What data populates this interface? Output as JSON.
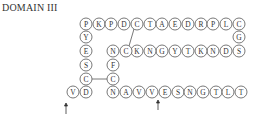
{
  "title": "DOMAIN III",
  "chart_data": {
    "type": "diagram",
    "residue_radius": 6,
    "residues": [
      {
        "id": "top-0",
        "letter": "P",
        "x": 86,
        "y": 24
      },
      {
        "id": "top-1",
        "letter": "K",
        "x": 99,
        "y": 24
      },
      {
        "id": "top-2",
        "letter": "P",
        "x": 111,
        "y": 24
      },
      {
        "id": "top-3",
        "letter": "D",
        "x": 124,
        "y": 24
      },
      {
        "id": "top-4",
        "letter": "C",
        "x": 137,
        "y": 24
      },
      {
        "id": "top-5",
        "letter": "T",
        "x": 150,
        "y": 24
      },
      {
        "id": "top-6",
        "letter": "A",
        "x": 162,
        "y": 24
      },
      {
        "id": "top-7",
        "letter": "E",
        "x": 175,
        "y": 24
      },
      {
        "id": "top-8",
        "letter": "D",
        "x": 188,
        "y": 24
      },
      {
        "id": "top-9",
        "letter": "R",
        "x": 201,
        "y": 24
      },
      {
        "id": "top-10",
        "letter": "P",
        "x": 213,
        "y": 24
      },
      {
        "id": "top-11",
        "letter": "L",
        "x": 226,
        "y": 24
      },
      {
        "id": "top-12",
        "letter": "C",
        "x": 239,
        "y": 24
      },
      {
        "id": "right-0",
        "letter": "G",
        "x": 239,
        "y": 37
      },
      {
        "id": "mid-10",
        "letter": "S",
        "x": 239,
        "y": 51
      },
      {
        "id": "mid-9",
        "letter": "D",
        "x": 226,
        "y": 51
      },
      {
        "id": "mid-8",
        "letter": "N",
        "x": 213,
        "y": 51
      },
      {
        "id": "mid-7",
        "letter": "K",
        "x": 201,
        "y": 51
      },
      {
        "id": "mid-6",
        "letter": "T",
        "x": 188,
        "y": 51
      },
      {
        "id": "mid-5",
        "letter": "Y",
        "x": 175,
        "y": 51
      },
      {
        "id": "mid-4",
        "letter": "G",
        "x": 162,
        "y": 51
      },
      {
        "id": "mid-3",
        "letter": "N",
        "x": 150,
        "y": 51
      },
      {
        "id": "mid-2",
        "letter": "K",
        "x": 137,
        "y": 51
      },
      {
        "id": "mid-1",
        "letter": "C",
        "x": 126,
        "y": 51
      },
      {
        "id": "mid-0",
        "letter": "N",
        "x": 113,
        "y": 51
      },
      {
        "id": "inner-0",
        "letter": "F",
        "x": 113,
        "y": 65
      },
      {
        "id": "inner-1",
        "letter": "C",
        "x": 113,
        "y": 79
      },
      {
        "id": "bot-0",
        "letter": "N",
        "x": 113,
        "y": 92
      },
      {
        "id": "bot-1",
        "letter": "A",
        "x": 126,
        "y": 92
      },
      {
        "id": "bot-2",
        "letter": "V",
        "x": 139,
        "y": 92
      },
      {
        "id": "bot-3",
        "letter": "V",
        "x": 152,
        "y": 92
      },
      {
        "id": "bot-4",
        "letter": "E",
        "x": 165,
        "y": 92
      },
      {
        "id": "bot-5",
        "letter": "S",
        "x": 178,
        "y": 92
      },
      {
        "id": "bot-6",
        "letter": "N",
        "x": 190,
        "y": 92
      },
      {
        "id": "bot-7",
        "letter": "G",
        "x": 203,
        "y": 92
      },
      {
        "id": "bot-8",
        "letter": "T",
        "x": 216,
        "y": 92
      },
      {
        "id": "bot-9",
        "letter": "L",
        "x": 228,
        "y": 92
      },
      {
        "id": "bot-10",
        "letter": "T",
        "x": 241,
        "y": 92
      },
      {
        "id": "left-1",
        "letter": "Y",
        "x": 86,
        "y": 37
      },
      {
        "id": "left-2",
        "letter": "E",
        "x": 86,
        "y": 51
      },
      {
        "id": "left-3",
        "letter": "S",
        "x": 86,
        "y": 65
      },
      {
        "id": "left-4",
        "letter": "C",
        "x": 86,
        "y": 79
      },
      {
        "id": "left-5",
        "letter": "D",
        "x": 86,
        "y": 92
      },
      {
        "id": "left-6",
        "letter": "V",
        "x": 73,
        "y": 92
      }
    ],
    "bonds": [
      {
        "from": "top-4",
        "to": "mid-1",
        "x1": 134,
        "y1": 29,
        "x2": 129,
        "y2": 46
      },
      {
        "from": "left-4",
        "to": "inner-1",
        "x1": 92,
        "y1": 79,
        "x2": 107,
        "y2": 79
      }
    ],
    "arrows": [
      {
        "name": "cleavage-arrow-1",
        "x": 66,
        "y_tail": 114,
        "y_head": 103,
        "direction": "up"
      },
      {
        "name": "cleavage-arrow-2",
        "x": 158,
        "y_tail": 110,
        "y_head": 100,
        "direction": "up"
      }
    ]
  }
}
